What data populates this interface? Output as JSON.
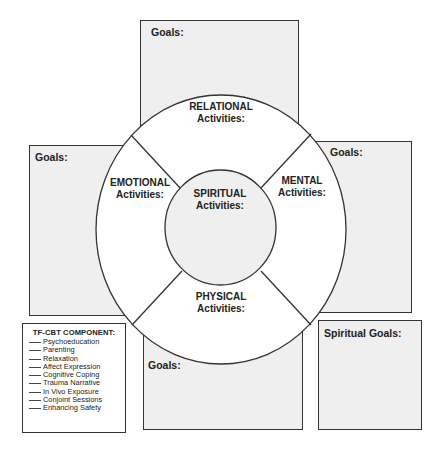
{
  "goal_boxes": {
    "relational": {
      "label": "Goals:"
    },
    "emotional": {
      "label": "Goals:"
    },
    "mental": {
      "label": "Goals:"
    },
    "physical": {
      "label": "Goals:"
    },
    "spiritual": {
      "label": "Spiritual Goals:"
    }
  },
  "wheel": {
    "relational": {
      "title": "RELATIONAL",
      "subtitle": "Activities:"
    },
    "emotional": {
      "title": "EMOTIONAL",
      "subtitle": "Activities:"
    },
    "mental": {
      "title": "MENTAL",
      "subtitle": "Activities:"
    },
    "physical": {
      "title": "PHYSICAL",
      "subtitle": "Activities:"
    },
    "spiritual": {
      "title": "SPIRITUAL",
      "subtitle": "Activities:"
    }
  },
  "tfcbt": {
    "title": "TF-CBT COMPONENT:",
    "items": [
      "Psychoeducation",
      "Parenting",
      "Relaxation",
      "Affect Expression",
      "Cognitive Coping",
      "Trauma Narrative",
      "In Vivo Exposure",
      "Conjoint Sessions",
      "Enhancing Safety"
    ]
  },
  "colors": {
    "box_fill": "#efefef",
    "stroke": "#333333",
    "wheel_fill": "#ffffff",
    "center_fill": "#efefef"
  }
}
